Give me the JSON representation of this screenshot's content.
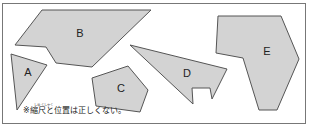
{
  "figure": {
    "shapes": [
      {
        "label": "A",
        "points": "11,54 47,65 17,110",
        "label_pos": [
          28,
          73
        ]
      },
      {
        "label": "B",
        "points": "42,10 151,10 92,67 56,63 46,47 15,45",
        "label_pos": [
          80,
          34
        ]
      },
      {
        "label": "C",
        "points": "92,78 128,66 148,90 140,112 96,106",
        "label_pos": [
          121,
          89
        ]
      },
      {
        "label": "D",
        "points": "130,45 227,69 212,99 210,88 192,88 193,104",
        "label_pos": [
          187,
          74
        ]
      },
      {
        "label": "E",
        "points": "218,16 281,16 299,59 277,110 259,110 243,58 216,53",
        "label_pos": [
          267,
          52
        ]
      }
    ],
    "note": {
      "text": "※縮尺と位置は正しくない。",
      "ruby": "しゅくしゃく"
    },
    "colors": {
      "fill": "#d3d3d3",
      "stroke": "#555555",
      "frame": "#777777"
    }
  }
}
